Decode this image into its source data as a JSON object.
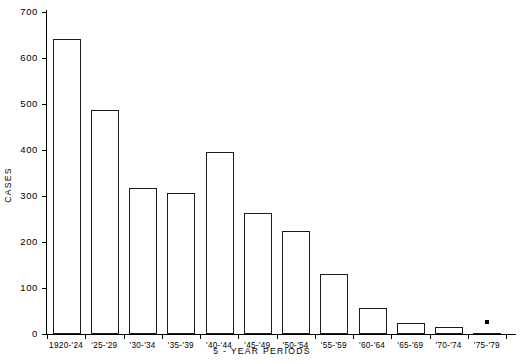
{
  "chart_data": {
    "type": "bar",
    "title": "",
    "xlabel": "5 - YEAR PERIODS",
    "ylabel": "CASES",
    "categories": [
      "1920-'24",
      "'25-'29",
      "'30-'34",
      "'35-'39",
      "'40-'44",
      "'45-'49",
      "'50-'54",
      "'55-'59",
      "'60-'64",
      "'65-'69",
      "'70-'74",
      "'75-'79"
    ],
    "values": [
      641,
      487,
      317,
      307,
      395,
      263,
      223,
      130,
      56,
      23,
      16,
      3
    ],
    "ylim": [
      0,
      700
    ],
    "ytick_labels": [
      "0",
      "100",
      "200",
      "300",
      "400",
      "500",
      "600",
      "700"
    ],
    "ytick_values": [
      0,
      100,
      200,
      300,
      400,
      500,
      600,
      700
    ],
    "grid": false,
    "legend": null,
    "annotations": [
      {
        "category": "'75-'79",
        "symbol": "dot-marker",
        "note": "marker above final bar"
      }
    ],
    "colors": {
      "bar_fill": "#ffffff",
      "bar_stroke": "#1a1a1a",
      "axis": "#000000",
      "text": "#000000"
    }
  },
  "footer": {
    "fragment_text": ""
  }
}
